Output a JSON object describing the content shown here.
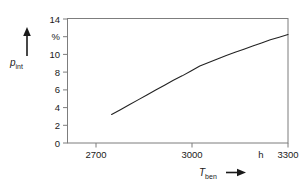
{
  "chart_data": {
    "type": "line",
    "title": "",
    "subtitle": "",
    "xlabel": "T_ben",
    "xlabel_symbol": "T",
    "xlabel_subscript": "ben",
    "xunit": "h",
    "ylabel": "p_int",
    "ylabel_symbol": "p",
    "ylabel_subscript": "int",
    "yunit": "%",
    "xlim": [
      2550,
      3300
    ],
    "ylim": [
      0,
      14
    ],
    "xticks": [
      2700,
      3000,
      3300
    ],
    "xtick_labels": [
      "2700",
      "3000",
      "3300"
    ],
    "yticks": [
      0,
      2,
      4,
      6,
      8,
      10,
      14
    ],
    "ytick_labels": [
      "0",
      "2",
      "4",
      "6",
      "8",
      "10",
      "14"
    ],
    "grid": false,
    "legend": false,
    "legend_position": "none",
    "series": [
      {
        "name": "p_int",
        "x": [
          2700,
          2730,
          2760,
          2790,
          2820,
          2850,
          2880,
          2910,
          2940,
          2970,
          3000,
          3030,
          3060,
          3090,
          3120,
          3150,
          3180,
          3210,
          3240,
          3270,
          3300
        ],
        "values": [
          3.2,
          3.75,
          4.3,
          4.85,
          5.4,
          5.95,
          6.5,
          7.05,
          7.55,
          8.1,
          8.65,
          9.05,
          9.45,
          9.85,
          10.2,
          10.55,
          10.9,
          11.25,
          11.6,
          11.9,
          12.2
        ]
      }
    ],
    "annotations": [
      {
        "text": "%",
        "role": "y-axis-unit"
      },
      {
        "text": "h",
        "role": "x-axis-unit"
      }
    ],
    "colors": {
      "curve": "#222222",
      "axis": "#6a6a6a",
      "text": "#1a1a1a",
      "background": "#ffffff"
    }
  },
  "axis": {
    "y_unit": "%",
    "x_unit": "h",
    "y_symbol": "p",
    "y_subscript": "int",
    "x_symbol": "T",
    "x_subscript": "ben",
    "arrow": "→"
  },
  "ticks": {
    "y": [
      {
        "label": "14",
        "value": 14
      },
      {
        "label": "10",
        "value": 10
      },
      {
        "label": "8",
        "value": 8
      },
      {
        "label": "6",
        "value": 6
      },
      {
        "label": "4",
        "value": 4
      },
      {
        "label": "2",
        "value": 2
      },
      {
        "label": "0",
        "value": 0
      }
    ],
    "x": [
      {
        "label": "2700",
        "value": 2700
      },
      {
        "label": "3000",
        "value": 3000
      },
      {
        "label": "3300",
        "value": 3300
      }
    ]
  }
}
